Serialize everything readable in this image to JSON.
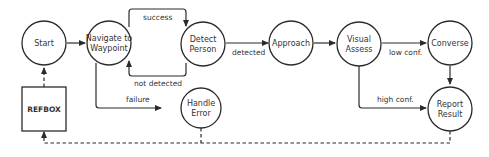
{
  "diagram": {
    "nodes": {
      "start": {
        "label": "Start"
      },
      "navigate": {
        "line1": "Navigate to",
        "line2": "Waypoint"
      },
      "detect": {
        "line1": "Detect",
        "line2": "Person"
      },
      "approach": {
        "label": "Approach"
      },
      "visual": {
        "line1": "Visual",
        "line2": "Assess"
      },
      "converse": {
        "label": "Converse"
      },
      "handle": {
        "line1": "Handle",
        "line2": "Error"
      },
      "report": {
        "line1": "Report",
        "line2": "Result"
      },
      "refbox": {
        "label": "REFBOX"
      }
    },
    "edges": {
      "success": "success",
      "not_detected": "not detected",
      "failure": "failure",
      "detected": "detected",
      "low_conf": "low conf.",
      "high_conf": "high conf."
    },
    "colors": {
      "stroke": "#2b2b2b",
      "text": "#333333",
      "background": "#ffffff"
    }
  }
}
